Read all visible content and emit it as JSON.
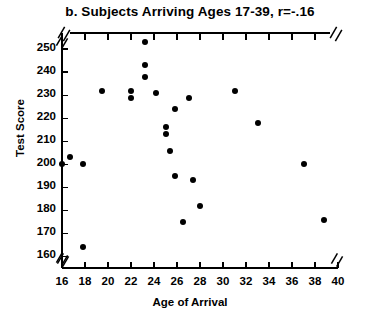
{
  "chart_data": {
    "type": "scatter",
    "title": "b. Subjects Arriving Ages 17-39, r=-.16",
    "xlabel": "Age of Arrival",
    "ylabel": "Test Score",
    "xlim": [
      16,
      40
    ],
    "ylim": [
      155,
      257
    ],
    "grid": false,
    "legend": null,
    "axis_break_x": [
      "left",
      "right"
    ],
    "axis_break_y": [
      "top",
      "bottom"
    ],
    "xticks": [
      16,
      18,
      20,
      22,
      24,
      26,
      28,
      30,
      32,
      34,
      36,
      38,
      40
    ],
    "xtick_labels": [
      "16",
      "18",
      "20",
      "22",
      "24",
      "26",
      "28",
      "30",
      "32",
      "34",
      "36",
      "38",
      "40"
    ],
    "xticks_minor": [
      17,
      19,
      21,
      23,
      25,
      27,
      29,
      31,
      33,
      35,
      37,
      39
    ],
    "yticks": [
      160,
      170,
      180,
      190,
      200,
      210,
      220,
      230,
      240,
      250
    ],
    "ytick_labels": [
      "160",
      "170",
      "180",
      "190",
      "200",
      "210",
      "220",
      "230",
      "240",
      "250"
    ],
    "marker_color": "#000000",
    "marker_size_px": 6,
    "points": [
      {
        "x": 16.0,
        "y": 200
      },
      {
        "x": 16.7,
        "y": 203
      },
      {
        "x": 17.8,
        "y": 200
      },
      {
        "x": 17.8,
        "y": 164
      },
      {
        "x": 19.5,
        "y": 232
      },
      {
        "x": 22.0,
        "y": 232
      },
      {
        "x": 22.0,
        "y": 229
      },
      {
        "x": 23.2,
        "y": 238
      },
      {
        "x": 23.2,
        "y": 253
      },
      {
        "x": 23.2,
        "y": 243
      },
      {
        "x": 24.2,
        "y": 231
      },
      {
        "x": 25.0,
        "y": 216
      },
      {
        "x": 25.0,
        "y": 213
      },
      {
        "x": 25.4,
        "y": 206
      },
      {
        "x": 25.8,
        "y": 224
      },
      {
        "x": 25.8,
        "y": 195
      },
      {
        "x": 26.5,
        "y": 175
      },
      {
        "x": 27.0,
        "y": 229
      },
      {
        "x": 27.4,
        "y": 193
      },
      {
        "x": 28.0,
        "y": 182
      },
      {
        "x": 31.0,
        "y": 232
      },
      {
        "x": 33.0,
        "y": 218
      },
      {
        "x": 37.0,
        "y": 200
      },
      {
        "x": 38.8,
        "y": 176
      }
    ]
  },
  "plot_area": {
    "left_px": 62,
    "right_px": 338,
    "top_px": 33,
    "bottom_px": 268
  }
}
